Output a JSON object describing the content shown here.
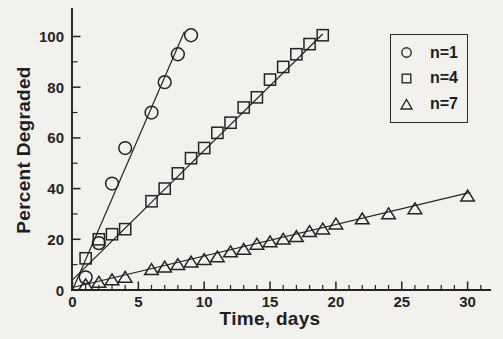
{
  "figure_kind": "scanned journal scatter plot",
  "colors": {
    "ink": "#242424",
    "paper": "#f2f1ed"
  },
  "chart_data": {
    "type": "scatter",
    "title": "",
    "xlabel": "Time, days",
    "ylabel": "Percent Degraded",
    "grid": false,
    "legend_position": "upper right",
    "x_axis": {
      "min": 0,
      "max": 31.8,
      "major_ticks": [
        0,
        5,
        10,
        15,
        20,
        25,
        30
      ],
      "minor_tick_step": 1
    },
    "y_axis": {
      "min": 0,
      "max": 111,
      "major_ticks": [
        0,
        20,
        40,
        60,
        80,
        100
      ],
      "minor_tick_step": 10
    },
    "series": [
      {
        "name": "n=1",
        "marker": "circle",
        "points": [
          [
            1,
            5
          ],
          [
            2,
            18.5
          ],
          [
            3,
            42
          ],
          [
            4,
            56
          ],
          [
            6,
            70
          ],
          [
            7,
            82
          ],
          [
            8,
            93
          ],
          [
            9,
            100.5
          ]
        ],
        "fit_line": [
          [
            0,
            0
          ],
          [
            8.5,
            102
          ]
        ]
      },
      {
        "name": "n=4",
        "marker": "square",
        "points": [
          [
            1,
            12.5
          ],
          [
            2,
            20
          ],
          [
            3,
            22
          ],
          [
            4,
            24
          ],
          [
            6,
            35
          ],
          [
            7,
            40
          ],
          [
            8,
            46
          ],
          [
            9,
            52
          ],
          [
            10,
            56
          ],
          [
            11,
            62
          ],
          [
            12,
            66
          ],
          [
            13,
            72
          ],
          [
            14,
            76
          ],
          [
            15,
            83
          ],
          [
            16,
            88
          ],
          [
            17,
            93
          ],
          [
            18,
            97
          ],
          [
            19,
            100.5
          ]
        ],
        "fit_line": [
          [
            0,
            4
          ],
          [
            19,
            101
          ]
        ]
      },
      {
        "name": "n=7",
        "marker": "triangle",
        "points": [
          [
            1,
            2
          ],
          [
            2,
            3
          ],
          [
            3,
            4
          ],
          [
            4,
            5
          ],
          [
            6,
            8
          ],
          [
            7,
            9
          ],
          [
            8,
            10
          ],
          [
            9,
            11
          ],
          [
            10,
            12
          ],
          [
            11,
            13
          ],
          [
            12,
            15
          ],
          [
            13,
            16
          ],
          [
            14,
            18
          ],
          [
            15,
            19
          ],
          [
            16,
            20
          ],
          [
            17,
            21
          ],
          [
            18,
            23
          ],
          [
            19,
            24
          ],
          [
            20,
            26
          ],
          [
            22,
            28
          ],
          [
            24,
            30
          ],
          [
            26,
            32
          ],
          [
            30,
            37
          ]
        ],
        "fit_line": [
          [
            0,
            1
          ],
          [
            30.2,
            38.5
          ]
        ]
      }
    ],
    "legend": [
      {
        "marker": "circle",
        "label": "n=1"
      },
      {
        "marker": "square",
        "label": "n=4"
      },
      {
        "marker": "triangle",
        "label": "n=7"
      }
    ]
  }
}
